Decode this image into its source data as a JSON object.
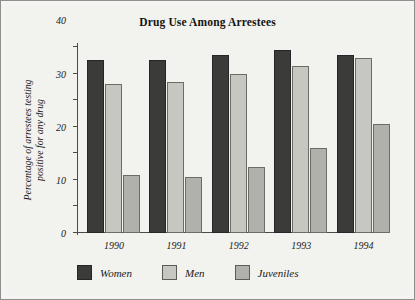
{
  "chart_data": {
    "type": "bar",
    "title": "Drug Use Among Arrestees",
    "xlabel": "",
    "ylabel": "Percentage of arrestees testing positive for any drug",
    "ylabel_lines": [
      "Percentage of arrestees testing",
      "positive for any drug"
    ],
    "categories": [
      "1990",
      "1991",
      "1992",
      "1993",
      "1994"
    ],
    "series": [
      {
        "name": "Women",
        "color": "#3b3b3a",
        "values": [
          65,
          65,
          67,
          69,
          67
        ]
      },
      {
        "name": "Men",
        "color": "#c7c7c2",
        "values": [
          56,
          57,
          60,
          63,
          66
        ]
      },
      {
        "name": "Juveniles",
        "color": "#b1b1ab",
        "values": [
          22,
          21,
          25,
          32,
          41
        ]
      }
    ],
    "ylim": [
      0,
      70
    ],
    "yticks": [
      0,
      10,
      20,
      30,
      40,
      50,
      60,
      70
    ],
    "ytick_labels": [
      "0",
      "10",
      "20",
      "30",
      "40",
      "50",
      "60",
      "70"
    ],
    "grid": false,
    "legend_position": "bottom-left",
    "axis_color": "#4a4a46",
    "background": "#f2f2ef"
  }
}
